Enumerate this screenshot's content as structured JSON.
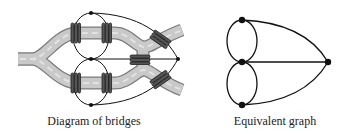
{
  "figure": {
    "left_panel": {
      "caption": "Diagram of bridges",
      "description": "Königsberg river with islands and seven bridges, overlaid with graph",
      "node_count": 4,
      "bridge_count": 7
    },
    "right_panel": {
      "caption": "Equivalent graph",
      "nodes": [
        "top",
        "middle",
        "bottom",
        "right"
      ],
      "edges": [
        [
          "top",
          "middle"
        ],
        [
          "top",
          "middle"
        ],
        [
          "middle",
          "bottom"
        ],
        [
          "middle",
          "bottom"
        ],
        [
          "top",
          "right"
        ],
        [
          "middle",
          "right"
        ],
        [
          "bottom",
          "right"
        ]
      ]
    }
  },
  "colors": {
    "river_fill": "#c8c8c8",
    "river_edge": "#7a7a7a",
    "line": "#111111",
    "bridge": "#333333"
  }
}
